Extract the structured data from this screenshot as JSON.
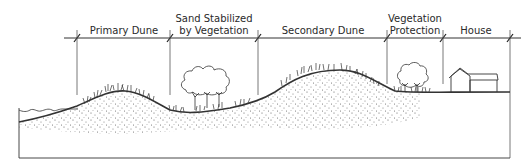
{
  "diagram": {
    "zones": [
      {
        "id": "primary-dune",
        "lines": [
          "Primary Dune"
        ],
        "x_start": 77,
        "x_end": 170
      },
      {
        "id": "sand-stabilized",
        "lines": [
          "Sand Stabilized",
          "by Vegetation"
        ],
        "x_start": 170,
        "x_end": 258
      },
      {
        "id": "secondary-dune",
        "lines": [
          "Secondary Dune"
        ],
        "x_start": 258,
        "x_end": 387
      },
      {
        "id": "vegetation-protection",
        "lines": [
          "Vegetation",
          "Protection"
        ],
        "x_start": 387,
        "x_end": 443
      },
      {
        "id": "house",
        "lines": [
          "House"
        ],
        "x_start": 443,
        "x_end": 510
      }
    ],
    "colors": {
      "line": "#333333",
      "text": "#2a2a2a",
      "background": "#ffffff"
    }
  }
}
